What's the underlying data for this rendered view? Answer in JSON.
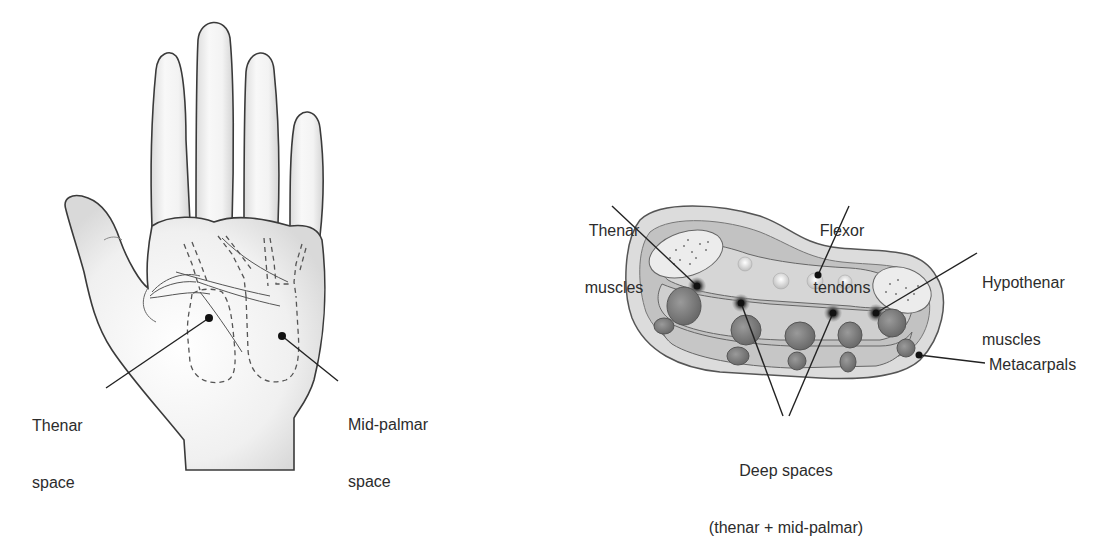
{
  "figure": {
    "left_panel": {
      "subject": "palm of hand with deep palmar spaces outlined (dashed)",
      "labels": {
        "thenar_space_line1": "Thenar",
        "thenar_space_line2": "space",
        "midpalmar_space_line1": "Mid-palmar",
        "midpalmar_space_line2": "space"
      }
    },
    "right_panel": {
      "subject": "cross-section of the palm",
      "labels": {
        "thenar_muscles_line1": "Thenar",
        "thenar_muscles_line2": "muscles",
        "flexor_tendons_line1": "Flexor",
        "flexor_tendons_line2": "tendons",
        "hypothenar_muscles_line1": "Hypothenar",
        "hypothenar_muscles_line2": "muscles",
        "metacarpals": "Metacarpals",
        "deep_spaces_line1": "Deep spaces",
        "deep_spaces_line2": "(thenar + mid-palmar)"
      }
    }
  },
  "colors": {
    "outline": "#3a3a3a",
    "skin": "#f2f2f2",
    "skin_shadow": "#d8d8d8",
    "tissue": "#c9c9c9",
    "dark_tissue": "#7a7a7a",
    "leader_line": "#222222"
  }
}
